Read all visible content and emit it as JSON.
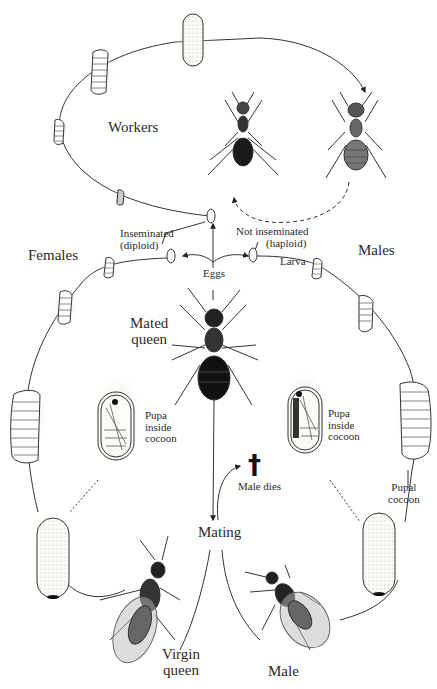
{
  "groups": {
    "workers": "Workers",
    "females": "Females",
    "males": "Males"
  },
  "eggs": {
    "label": "Eggs",
    "inseminated": [
      "Inseminated",
      "(diploid)"
    ],
    "not_inseminated": [
      "Not inseminated",
      "(haploid)"
    ],
    "larva": "Larva"
  },
  "queen": {
    "mated": [
      "Mated",
      "queen"
    ],
    "virgin": [
      "Virgin",
      "queen"
    ]
  },
  "pupa": {
    "left": [
      "Pupa",
      "inside",
      "cocoon"
    ],
    "right": [
      "Pupa",
      "inside",
      "cocoon"
    ],
    "pupal_cocoon": [
      "Pupal",
      "cocoon"
    ]
  },
  "events": {
    "mating": "Mating",
    "male_dies": "Male dies",
    "male_dies_symbol": "†"
  },
  "male": "Male",
  "colors": {
    "line": "#333333",
    "ant_dark": "#1a1a1a",
    "ant_mid": "#555555",
    "cocoon_fill": "#fbfbf7",
    "shadow": "#cfcfcf"
  }
}
